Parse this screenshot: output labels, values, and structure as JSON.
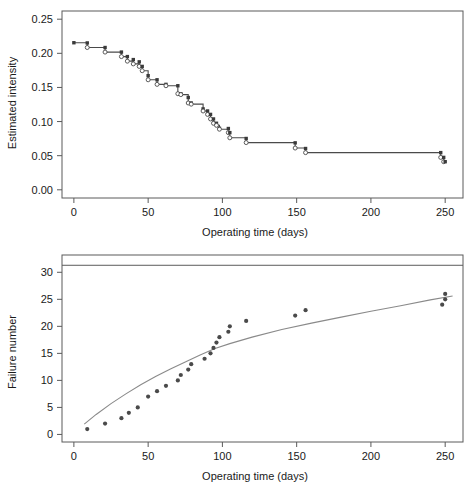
{
  "figure": {
    "title": "",
    "background": "#ffffff",
    "panel_count": 2
  },
  "chart_data": [
    {
      "id": "estimated-intensity",
      "type": "line",
      "variant": "step",
      "title": "",
      "xlabel": "Operating time (days)",
      "ylabel": "Estimated intensity",
      "xlim": [
        -8,
        262
      ],
      "ylim": [
        -0.012,
        0.262
      ],
      "xticks": [
        0,
        50,
        100,
        150,
        200,
        250
      ],
      "xticklabels": [
        "0",
        "50",
        "100",
        "150",
        "200",
        "250"
      ],
      "yticks": [
        0.0,
        0.05,
        0.1,
        0.15,
        0.2,
        0.25
      ],
      "yticklabels": [
        "0.00",
        "0.05",
        "0.10",
        "0.15",
        "0.20",
        "0.25"
      ],
      "grid": false,
      "legend": null,
      "marker_square_color": "#3a3a3a",
      "marker_circle_color": "#ffffff",
      "line_color": "#4a4a4a",
      "x": [
        0,
        9,
        21,
        32,
        36,
        40,
        44,
        46,
        50,
        56,
        62,
        70,
        72,
        77,
        79,
        87,
        90,
        92,
        94,
        96,
        98,
        104,
        105,
        116,
        149,
        156,
        247,
        249,
        250
      ],
      "y_upper": [
        0.2155,
        0.2152,
        0.2085,
        0.2018,
        0.1952,
        0.1908,
        0.1875,
        0.1808,
        0.1672,
        0.1612,
        0.1545,
        0.1525,
        0.1408,
        0.1352,
        0.1272,
        0.1185,
        0.1155,
        0.1105,
        0.1038,
        0.0975,
        0.0902,
        0.0898,
        0.0838,
        0.0752,
        0.0688,
        0.0605,
        0.0545,
        0.0475,
        0.0412
      ],
      "y_lower": [
        0.2155,
        0.2085,
        0.2018,
        0.1952,
        0.1885,
        0.1845,
        0.1808,
        0.1745,
        0.1612,
        0.1545,
        0.1525,
        0.1408,
        0.1395,
        0.1272,
        0.1255,
        0.1155,
        0.1105,
        0.1038,
        0.0975,
        0.0945,
        0.0888,
        0.0838,
        0.0762,
        0.0692,
        0.0612,
        0.0545,
        0.0475,
        0.0412,
        0.0412
      ],
      "description": "Decreasing step function of estimated failure intensity versus operating time"
    },
    {
      "id": "failure-number",
      "type": "scatter",
      "title": "",
      "xlabel": "Operating time (days)",
      "ylabel": "Failure number",
      "xlim": [
        -8,
        262
      ],
      "ylim": [
        -1.4,
        33.2
      ],
      "xticks": [
        0,
        50,
        100,
        150,
        200,
        250
      ],
      "xticklabels": [
        "0",
        "50",
        "100",
        "150",
        "200",
        "250"
      ],
      "yticks": [
        0,
        5,
        10,
        15,
        20,
        25,
        30
      ],
      "yticklabels": [
        "0",
        "5",
        "10",
        "15",
        "20",
        "25",
        "30"
      ],
      "grid": false,
      "legend": null,
      "marker_color": "#4a4a4a",
      "curve_color": "#8a8a8a",
      "asymptote_value": 31.3,
      "asymptote_color": "#5a5a5a",
      "points_x": [
        9,
        21,
        32,
        37,
        43,
        50,
        56,
        62,
        70,
        72,
        77,
        79,
        88,
        92,
        94,
        96,
        98,
        104,
        105,
        116,
        149,
        156,
        248,
        250,
        250
      ],
      "points_y": [
        1,
        2,
        3,
        4,
        5,
        7,
        8,
        9,
        10,
        11,
        12,
        13,
        14,
        15,
        16,
        17,
        18,
        19,
        20,
        21,
        22,
        23,
        24,
        25,
        26
      ],
      "curve_x": [
        7,
        15,
        25,
        35,
        45,
        55,
        65,
        75,
        85,
        95,
        105,
        120,
        140,
        160,
        180,
        200,
        220,
        240,
        255
      ],
      "curve_y": [
        1.9,
        3.7,
        5.7,
        7.5,
        9.2,
        10.7,
        12.1,
        13.4,
        14.7,
        15.9,
        16.8,
        18.0,
        19.4,
        20.6,
        21.7,
        22.8,
        23.8,
        24.9,
        25.6
      ],
      "description": "Cumulative failure number versus operating time with fitted mean value function and asymptote"
    }
  ]
}
